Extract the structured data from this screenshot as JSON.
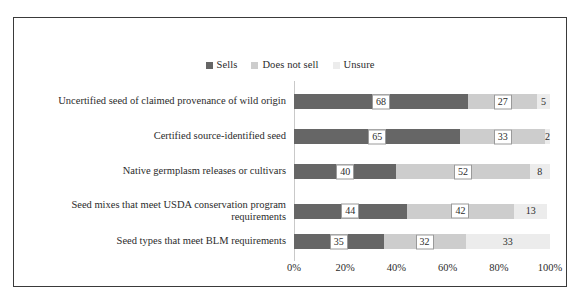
{
  "chart_data": {
    "type": "bar",
    "subtype": "stacked-horizontal-100-percent",
    "title": "",
    "subtitle": "",
    "xlabel": "",
    "ylabel": "",
    "xlim": [
      0,
      100
    ],
    "xticks": [
      "0%",
      "20%",
      "40%",
      "60%",
      "80%",
      "100%"
    ],
    "xtick_values": [
      0,
      20,
      40,
      60,
      80,
      100
    ],
    "grid": false,
    "legend_position": "top-center",
    "categories": [
      "Uncertified seed of claimed provenance of wild origin",
      "Certified source-identified seed",
      "Native germplasm releases or cultivars",
      "Seed mixes that meet USDA conservation program requirements",
      "Seed types that meet BLM requirements"
    ],
    "series": [
      {
        "name": "Sells",
        "color": "#666666",
        "values": [
          68,
          65,
          40,
          44,
          35
        ]
      },
      {
        "name": "Does not sell",
        "color": "#cdcdcd",
        "values": [
          27,
          33,
          52,
          42,
          32
        ]
      },
      {
        "name": "Unsure",
        "color": "#ececec",
        "values": [
          5,
          2,
          8,
          13,
          33
        ]
      }
    ]
  },
  "legend": {
    "entries": [
      {
        "label": "Sells",
        "color": "#666666"
      },
      {
        "label": "Does not sell",
        "color": "#cdcdcd"
      },
      {
        "label": "Unsure",
        "color": "#ececec"
      }
    ]
  },
  "colors": {
    "sells": "#666666",
    "does_not_sell": "#cdcdcd",
    "unsure": "#ececec",
    "frame_border": "#3a3a3a",
    "axis_line": "#c9c9c9",
    "label_box_border": "#9a9a9a",
    "text": "#2b2b2b",
    "background": "#ffffff"
  }
}
